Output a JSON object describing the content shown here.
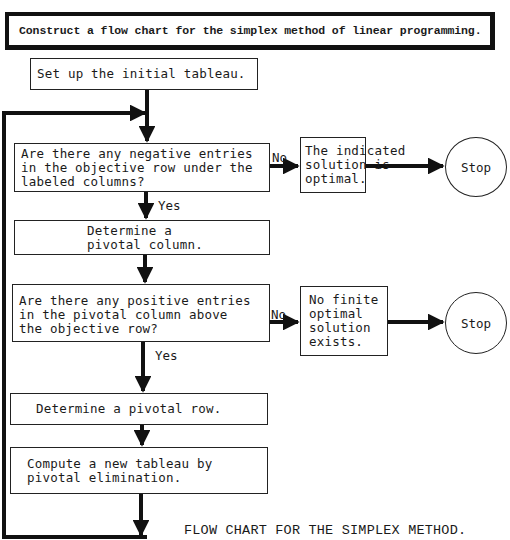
{
  "header": {
    "top_cut_text": "",
    "instruction": "Construct a flow chart for the simplex method of linear programming."
  },
  "flowchart": {
    "nodes": {
      "start": "Set up the initial tableau.",
      "decision_negative": "Are there any negative entries\nin the objective row under the\nlabeled columns?",
      "pivot_column": "Determine a\npivotal column.",
      "decision_positive": "Are there any positive entries\nin the pivotal column above\nthe objective row?",
      "pivot_row": "Determine a pivotal row.",
      "compute": "Compute a new tableau by\npivotal elimination.",
      "optimal": "The indicated\nsolution is\noptimal.",
      "no_finite": "No finite\noptimal\nsolution\nexists.",
      "stop_1": "Stop",
      "stop_2": "Stop"
    },
    "edge_labels": {
      "no_1": "No",
      "yes_1": "Yes",
      "no_2": "No",
      "yes_2": "Yes"
    },
    "edges": [
      {
        "from": "start",
        "to": "decision_negative"
      },
      {
        "from": "decision_negative",
        "to": "optimal",
        "label": "No"
      },
      {
        "from": "optimal",
        "to": "stop_1"
      },
      {
        "from": "decision_negative",
        "to": "pivot_column",
        "label": "Yes"
      },
      {
        "from": "pivot_column",
        "to": "decision_positive"
      },
      {
        "from": "decision_positive",
        "to": "no_finite",
        "label": "No"
      },
      {
        "from": "no_finite",
        "to": "stop_2"
      },
      {
        "from": "decision_positive",
        "to": "pivot_row",
        "label": "Yes"
      },
      {
        "from": "pivot_row",
        "to": "compute"
      },
      {
        "from": "compute",
        "to": "decision_negative",
        "label": "loop back"
      }
    ]
  },
  "caption": "FLOW CHART FOR THE SIMPLEX METHOD.",
  "colors": {
    "ink": "#1a1a1a",
    "background": "#ffffff"
  }
}
